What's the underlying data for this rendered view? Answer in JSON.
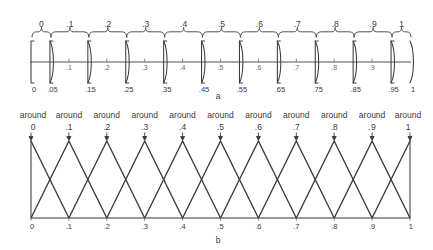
{
  "figure": {
    "caption_a": "a",
    "caption_b": "b",
    "width": 433,
    "height": 250,
    "line_color": "#3a3a3a",
    "axis_color": "#8c8c8c"
  },
  "panel_a": {
    "name": "crisp-intervals-panel",
    "axis": {
      "min": 0,
      "max": 1,
      "x_left_px": 31,
      "x_right_px": 410,
      "baseline_px": 62
    },
    "set_labels": [
      "0",
      ".1",
      ".2",
      ".3",
      ".4",
      ".5",
      ".6",
      ".7",
      ".8",
      ".9",
      "1"
    ],
    "set_centers": [
      0,
      0.1,
      0.2,
      0.3,
      0.4,
      0.5,
      0.6,
      0.7,
      0.8,
      0.9,
      1
    ],
    "interval_bounds": [
      [
        0,
        0.05
      ],
      [
        0.05,
        0.15
      ],
      [
        0.15,
        0.25
      ],
      [
        0.25,
        0.35
      ],
      [
        0.35,
        0.45
      ],
      [
        0.45,
        0.55
      ],
      [
        0.55,
        0.65
      ],
      [
        0.65,
        0.75
      ],
      [
        0.75,
        0.85
      ],
      [
        0.85,
        0.95
      ],
      [
        0.95,
        1
      ]
    ],
    "boundary_labels": [
      "0",
      ".05",
      ".15",
      ".25",
      ".35",
      ".45",
      ".55",
      ".65",
      ".75",
      ".85",
      ".95",
      "1"
    ],
    "boundary_values": [
      0,
      0.05,
      0.15,
      0.25,
      0.35,
      0.45,
      0.55,
      0.65,
      0.75,
      0.85,
      0.95,
      1
    ],
    "inner_axis_labels": [
      ".1",
      ".2",
      ".3",
      ".4",
      ".5",
      ".6",
      ".7",
      ".8",
      ".9"
    ],
    "inner_axis_values": [
      0.1,
      0.2,
      0.3,
      0.4,
      0.5,
      0.6,
      0.7,
      0.8,
      0.9
    ]
  },
  "panel_b": {
    "name": "fuzzy-triangles-panel",
    "axis": {
      "min": 0,
      "max": 1,
      "x_left_px": 31,
      "x_right_px": 410,
      "top_px": 141,
      "baseline_px": 218
    },
    "label_prefix": "around",
    "set_labels": [
      "0",
      ".1",
      ".2",
      ".3",
      ".4",
      ".5",
      ".6",
      ".7",
      ".8",
      ".9",
      "1"
    ],
    "peaks": [
      0,
      0.1,
      0.2,
      0.3,
      0.4,
      0.5,
      0.6,
      0.7,
      0.8,
      0.9,
      1
    ],
    "half_width": 0.1,
    "membership_max": 1,
    "axis_tick_labels": [
      "0",
      ".1",
      ".2",
      ".3",
      ".4",
      ".5",
      ".6",
      ".7",
      ".8",
      ".9",
      "1"
    ],
    "axis_tick_values": [
      0,
      0.1,
      0.2,
      0.3,
      0.4,
      0.5,
      0.6,
      0.7,
      0.8,
      0.9,
      1
    ]
  },
  "chart_data": {
    "type": "line",
    "title": "",
    "xlabel": "",
    "ylabel": "",
    "xlim": [
      0,
      1
    ],
    "ylim": [
      0,
      1
    ],
    "grid": false,
    "legend": "none",
    "panels": [
      {
        "id": "a",
        "type": "interval",
        "description": "crisp intervals on [0,1]",
        "categories": [
          "0",
          ".1",
          ".2",
          ".3",
          ".4",
          ".5",
          ".6",
          ".7",
          ".8",
          ".9",
          "1"
        ],
        "intervals": [
          [
            0,
            0.05
          ],
          [
            0.05,
            0.15
          ],
          [
            0.15,
            0.25
          ],
          [
            0.25,
            0.35
          ],
          [
            0.35,
            0.45
          ],
          [
            0.45,
            0.55
          ],
          [
            0.55,
            0.65
          ],
          [
            0.65,
            0.75
          ],
          [
            0.75,
            0.85
          ],
          [
            0.85,
            0.95
          ],
          [
            0.95,
            1
          ]
        ],
        "values": [
          1,
          1,
          1,
          1,
          1,
          1,
          1,
          1,
          1,
          1,
          1
        ]
      },
      {
        "id": "b",
        "type": "line",
        "description": "triangular fuzzy membership functions on [0,1]",
        "series": [
          {
            "name": "around 0",
            "x": [
              0,
              0.1
            ],
            "values": [
              1,
              0
            ]
          },
          {
            "name": "around .1",
            "x": [
              0,
              0.1,
              0.2
            ],
            "values": [
              0,
              1,
              0
            ]
          },
          {
            "name": "around .2",
            "x": [
              0.1,
              0.2,
              0.3
            ],
            "values": [
              0,
              1,
              0
            ]
          },
          {
            "name": "around .3",
            "x": [
              0.2,
              0.3,
              0.4
            ],
            "values": [
              0,
              1,
              0
            ]
          },
          {
            "name": "around .4",
            "x": [
              0.3,
              0.4,
              0.5
            ],
            "values": [
              0,
              1,
              0
            ]
          },
          {
            "name": "around .5",
            "x": [
              0.4,
              0.5,
              0.6
            ],
            "values": [
              0,
              1,
              0
            ]
          },
          {
            "name": "around .6",
            "x": [
              0.5,
              0.6,
              0.7
            ],
            "values": [
              0,
              1,
              0
            ]
          },
          {
            "name": "around .7",
            "x": [
              0.6,
              0.7,
              0.8
            ],
            "values": [
              0,
              1,
              0
            ]
          },
          {
            "name": "around .8",
            "x": [
              0.7,
              0.8,
              0.9
            ],
            "values": [
              0,
              1,
              0
            ]
          },
          {
            "name": "around .9",
            "x": [
              0.8,
              0.9,
              1.0
            ],
            "values": [
              0,
              1,
              0
            ]
          },
          {
            "name": "around 1",
            "x": [
              0.9,
              1.0
            ],
            "values": [
              0,
              1
            ]
          }
        ]
      }
    ]
  }
}
